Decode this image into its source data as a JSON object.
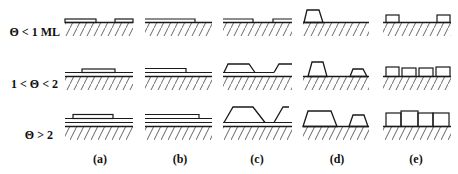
{
  "figure": {
    "rows": [
      {
        "label": "Θ < 1 ML",
        "y": 22
      },
      {
        "label": "1 < Θ < 2",
        "y": 76
      },
      {
        "label": "Θ > 2",
        "y": 126
      }
    ],
    "columns": [
      {
        "label": "(a)",
        "x_start": 65,
        "x_end": 133
      },
      {
        "label": "(b)",
        "x_start": 145,
        "x_end": 212
      },
      {
        "label": "(c)",
        "x_start": 223,
        "x_end": 292
      },
      {
        "label": "(d)",
        "x_start": 303,
        "x_end": 369
      },
      {
        "label": "(e)",
        "x_start": 385,
        "x_end": 451
      }
    ],
    "colors": {
      "line": "#1a1a1a",
      "hatch": "#555555",
      "background": "#ffffff"
    }
  }
}
